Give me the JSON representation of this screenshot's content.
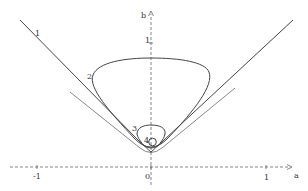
{
  "figure": {
    "axes": {
      "x_label": "a",
      "y_label": "b",
      "x_ticks": [
        {
          "label": "-1",
          "value": -1
        },
        {
          "label": "0",
          "value": 0
        },
        {
          "label": "1",
          "value": 1
        }
      ],
      "y_ticks": [
        {
          "label": "1",
          "value": 1
        }
      ],
      "style": "dashed",
      "color": "#555555"
    },
    "curves": [
      {
        "id": "1",
        "label": "1",
        "description": "outer V-shaped curve (wedge)"
      },
      {
        "id": "2",
        "label": "2",
        "description": "rounded triangular closed curve"
      },
      {
        "id": "3",
        "label": "3",
        "description": "small closed loop near origin"
      },
      {
        "id": "4",
        "label": "4",
        "description": "tiny circle near origin"
      }
    ],
    "curve_color": "#444444"
  }
}
